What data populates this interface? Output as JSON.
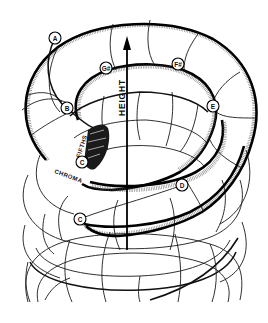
{
  "diagram": {
    "axis": {
      "label": "HEIGHT",
      "direction": "up"
    },
    "path_labels": {
      "fifths": "FIFTHS",
      "chroma": "CHROMA"
    },
    "note_nodes": [
      {
        "id": "A",
        "label": "A",
        "x": 55,
        "y": 38
      },
      {
        "id": "G#",
        "label": "G#",
        "x": 106,
        "y": 68
      },
      {
        "id": "F#",
        "label": "F#",
        "x": 178,
        "y": 64
      },
      {
        "id": "B",
        "label": "B",
        "x": 67,
        "y": 108
      },
      {
        "id": "E",
        "label": "E",
        "x": 213,
        "y": 106
      },
      {
        "id": "C-upper",
        "label": "C",
        "x": 82,
        "y": 162
      },
      {
        "id": "D",
        "label": "D",
        "x": 182,
        "y": 185
      },
      {
        "id": "C-lower",
        "label": "C",
        "x": 80,
        "y": 219
      }
    ],
    "colors": {
      "ink": "#000000",
      "background": "#ffffff",
      "node_fill": "#ffffff"
    }
  }
}
